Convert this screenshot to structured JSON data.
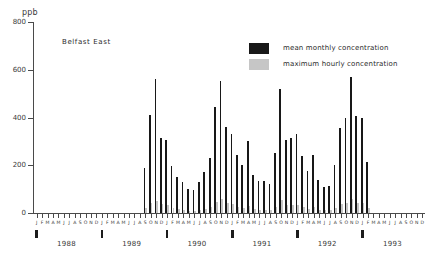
{
  "chart_data": {
    "type": "bar",
    "title": "Belfast East",
    "xlabel": "",
    "ylabel": "ppb",
    "ylim": [
      0,
      800
    ],
    "ytick_labels": [
      "0",
      "200",
      "400",
      "600",
      "800"
    ],
    "ytick_values": [
      0,
      200,
      400,
      600,
      800
    ],
    "grid": false,
    "legend_position": "top-right",
    "month_letters": [
      "J",
      "F",
      "M",
      "A",
      "M",
      "J",
      "J",
      "A",
      "S",
      "O",
      "N",
      "D"
    ],
    "year_labels": [
      "1988",
      "1989",
      "1990",
      "1991",
      "1992",
      "1993"
    ],
    "categories": [
      "J1988",
      "F1988",
      "M1988",
      "A1988",
      "M1988b",
      "J1988b",
      "J1988c",
      "A1988b",
      "S1988",
      "O1988",
      "N1988",
      "D1988",
      "J1989",
      "F1989",
      "M1989",
      "A1989",
      "M1989b",
      "J1989b",
      "J1989c",
      "A1989b",
      "S1989",
      "O1989",
      "N1989",
      "D1989",
      "J1990",
      "F1990",
      "M1990",
      "A1990",
      "M1990b",
      "J1990b",
      "J1990c",
      "A1990b",
      "S1990",
      "O1990",
      "N1990",
      "D1990",
      "J1991",
      "F1991",
      "M1991",
      "A1991",
      "M1991b",
      "J1991b",
      "J1991c",
      "A1991b",
      "S1991",
      "O1991",
      "N1991",
      "D1991",
      "J1992",
      "F1992",
      "M1992",
      "A1992",
      "M1992b",
      "J1992b",
      "J1992c",
      "A1992b",
      "S1992",
      "O1992",
      "N1992",
      "D1992",
      "J1993",
      "F1993",
      "M1993"
    ],
    "series": [
      {
        "name": "maximum hourly concentration",
        "color": "#181818",
        "values": [
          0,
          0,
          0,
          0,
          0,
          0,
          0,
          0,
          0,
          0,
          0,
          0,
          0,
          0,
          0,
          0,
          0,
          0,
          0,
          0,
          190,
          410,
          560,
          315,
          305,
          195,
          150,
          130,
          100,
          95,
          130,
          170,
          230,
          445,
          555,
          360,
          330,
          245,
          200,
          300,
          160,
          135,
          135,
          120,
          250,
          520,
          305,
          315,
          330,
          240,
          175,
          245,
          140,
          110,
          115,
          200,
          355,
          400,
          570,
          405,
          400,
          215,
          0
        ]
      },
      {
        "name": "mean monthly concentration",
        "color": "#c6c6c6",
        "values": [
          0,
          0,
          0,
          0,
          0,
          0,
          0,
          0,
          0,
          0,
          0,
          0,
          0,
          0,
          0,
          0,
          0,
          0,
          0,
          0,
          22,
          40,
          52,
          36,
          34,
          20,
          16,
          13,
          10,
          9,
          13,
          18,
          26,
          45,
          58,
          40,
          36,
          26,
          21,
          30,
          16,
          13,
          13,
          12,
          26,
          54,
          32,
          33,
          35,
          25,
          18,
          25,
          14,
          11,
          12,
          21,
          38,
          42,
          60,
          43,
          42,
          22,
          0
        ]
      }
    ]
  },
  "legend": {
    "items": [
      {
        "label": "mean monthly concentration",
        "swatch": "dark"
      },
      {
        "label": "maximum hourly concentration",
        "swatch": "light"
      }
    ]
  }
}
